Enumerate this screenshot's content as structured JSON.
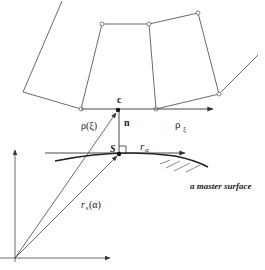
{
  "diagram": {
    "labels": {
      "c": "c",
      "n": "n",
      "rho_xi": "ρ(ξ)",
      "rho_sub_xi_main": "ρ",
      "rho_sub_xi_sub": "ξ",
      "S": "S",
      "r_alpha_main": "r",
      "r_alpha_sub": "α",
      "r_s_main": "r",
      "r_s_sub": "s",
      "r_s_arg": "(α)",
      "master_surface": "a master surface"
    },
    "colors": {
      "line": "#333333",
      "background": "#ffffff"
    },
    "slave_nodes": [
      {
        "x": 81,
        "y": 109
      },
      {
        "x": 102,
        "y": 24
      },
      {
        "x": 149,
        "y": 24
      },
      {
        "x": 198,
        "y": 13
      },
      {
        "x": 219,
        "y": 94
      },
      {
        "x": 156,
        "y": 109
      }
    ]
  }
}
